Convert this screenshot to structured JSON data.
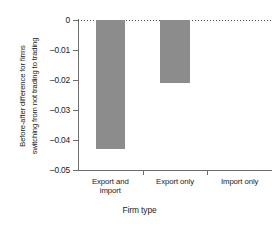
{
  "chart_data": {
    "type": "bar",
    "title": "",
    "subtitle": "",
    "categories": [
      "Export and import",
      "Export only",
      "Import only"
    ],
    "values": [
      -0.043,
      -0.021,
      0
    ],
    "xlabel": "Firm type",
    "ylabel": "Before-after difference for firms switching from not trading to trading",
    "ylabel_line1": "Before-after difference for firms",
    "ylabel_line2": "switching from not trading to trading",
    "ylim": [
      -0.05,
      0
    ],
    "yticks": [
      0,
      -0.01,
      -0.02,
      -0.03,
      -0.04,
      -0.05
    ],
    "ytick_labels": [
      "0",
      "–0.01",
      "–0.02",
      "–0.03",
      "–0.04",
      "–0.05"
    ],
    "grid": false,
    "legend": false,
    "legend_position": "none",
    "zero_reference_line": true,
    "bar_color": "#8c8c8c",
    "axis_color": "#6e6e6e",
    "text_color": "#1a1a1a",
    "background_color": "#ffffff",
    "category_labels_wrapped": [
      [
        "Export and",
        "import"
      ],
      [
        "Export only"
      ],
      [
        "Import only"
      ]
    ]
  }
}
